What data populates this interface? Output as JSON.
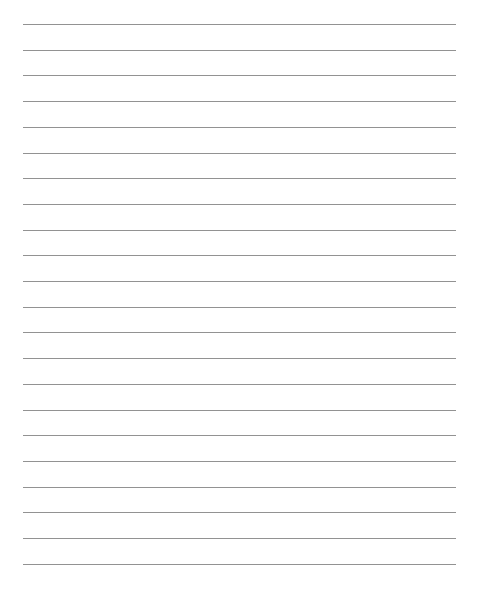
{
  "document": {
    "type": "lined-paper",
    "rule_color": "#8c8c8c",
    "background": "#ffffff",
    "rules": {
      "count": 22,
      "first_y": 24,
      "spacing": 25.7,
      "x_start": 23,
      "x_end": 456
    }
  }
}
